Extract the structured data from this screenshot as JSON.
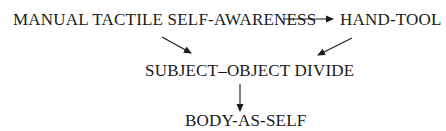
{
  "diagram": {
    "nodes": [
      {
        "id": "manual",
        "label": "MANUAL TACTILE SELF-AWARENESS"
      },
      {
        "id": "handtool",
        "label": "HAND-TOOL"
      },
      {
        "id": "divide",
        "label": "SUBJECT–OBJECT DIVIDE"
      },
      {
        "id": "body",
        "label": "BODY-AS-SELF"
      }
    ],
    "edges": [
      {
        "from": "manual",
        "to": "handtool"
      },
      {
        "from": "manual",
        "to": "divide"
      },
      {
        "from": "handtool",
        "to": "divide"
      },
      {
        "from": "divide",
        "to": "body"
      }
    ],
    "colors": {
      "text": "#1a1a1a",
      "arrow": "#1a1a1a",
      "background": "#ffffff"
    }
  }
}
